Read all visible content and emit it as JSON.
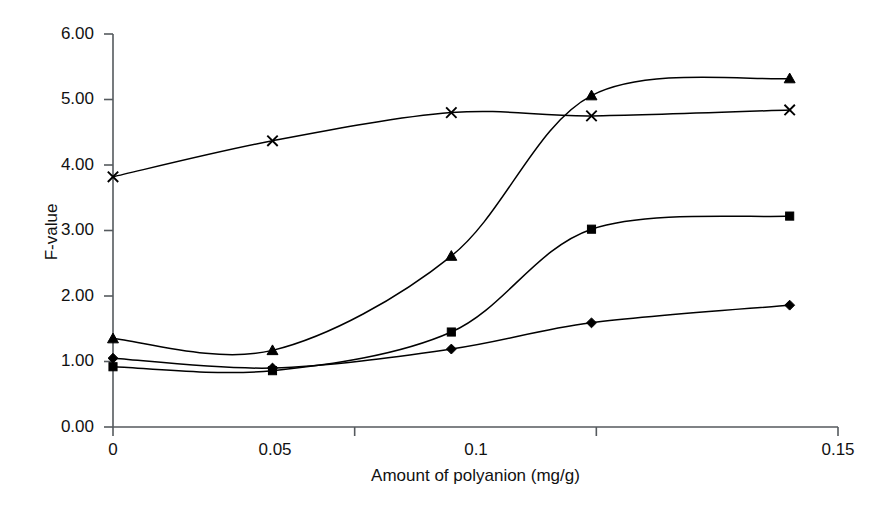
{
  "chart_data": {
    "type": "line",
    "title": "",
    "xlabel": "Amount of polyanion (mg/g)",
    "ylabel": "F-value",
    "xlim": [
      0,
      0.15
    ],
    "ylim": [
      0,
      6
    ],
    "xticks": [
      "0",
      "0.05",
      "0.1",
      "0.15"
    ],
    "xtick_values": [
      0,
      0.05,
      0.1,
      0.15
    ],
    "yticks": [
      "0.00",
      "1.00",
      "2.00",
      "3.00",
      "4.00",
      "5.00",
      "6.00"
    ],
    "ytick_values": [
      0,
      1,
      2,
      3,
      4,
      5,
      6
    ],
    "grid": false,
    "legend": "none",
    "x": [
      0,
      0.033,
      0.07,
      0.099,
      0.14
    ],
    "series": [
      {
        "name": "series-cross",
        "marker": "cross",
        "color": "#000000",
        "values": [
          3.82,
          4.37,
          4.8,
          4.75,
          4.84
        ]
      },
      {
        "name": "series-triangle",
        "marker": "triangle",
        "color": "#000000",
        "values": [
          1.35,
          1.17,
          2.61,
          5.06,
          5.32
        ]
      },
      {
        "name": "series-square",
        "marker": "square",
        "color": "#000000",
        "values": [
          0.92,
          0.86,
          1.45,
          3.02,
          3.22
        ]
      },
      {
        "name": "series-diamond",
        "marker": "diamond",
        "color": "#000000",
        "values": [
          1.05,
          0.9,
          1.19,
          1.59,
          1.86
        ]
      }
    ]
  },
  "axis": {
    "y_title": "F-value",
    "x_title": "Amount of polyanion (mg/g)",
    "y_labels": {
      "t0": "0.00",
      "t1": "1.00",
      "t2": "2.00",
      "t3": "3.00",
      "t4": "4.00",
      "t5": "5.00",
      "t6": "6.00"
    },
    "x_labels": {
      "t0": "0",
      "t1": "0.05",
      "t2": "0.1",
      "t3": "0.15"
    }
  }
}
